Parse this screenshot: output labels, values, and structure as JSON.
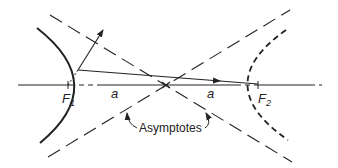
{
  "diagram": {
    "labels": {
      "focus1": "F",
      "focus1_sub": "1",
      "focus2": "F",
      "focus2_sub": "2",
      "a_left": "a",
      "a_right": "a",
      "asymptotes": "Asymptotes"
    },
    "colors": {
      "line": "#222222",
      "background": "#ffffff"
    },
    "elements": [
      "left hyperbola branch (solid)",
      "right hyperbola branch (dashed)",
      "two dashed asymptotes crossing at center",
      "transverse axis through foci",
      "ray from F2 direction reflecting off left branch",
      "reflected ray arrow outward"
    ]
  }
}
